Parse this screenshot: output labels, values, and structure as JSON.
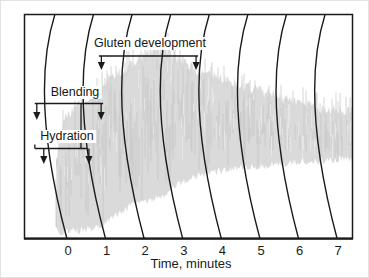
{
  "figure": {
    "background": "#ffffff",
    "line_color": "#1b1b1b",
    "trace_fill": "#dadada",
    "trace_streak_dark": "#c3c3c3",
    "trace_streak_light": "#e7e7e7"
  },
  "chart_data": {
    "type": "area",
    "subtype": "mixograph-recorder-trace",
    "title": "",
    "xlabel": "Time, minutes",
    "ylabel": "",
    "x_ticks": [
      "0",
      "1",
      "2",
      "3",
      "4",
      "5",
      "6",
      "7"
    ],
    "x_tick_values": [
      0,
      1,
      2,
      3,
      4,
      5,
      6,
      7
    ],
    "x_range_minutes": [
      -1.15,
      7.4
    ],
    "y_axis": "relative resistance (no scale shown)",
    "grid": "curved chart-recorder time arcs at each minute",
    "n_arcs": 8,
    "trace_start_minutes": -0.31,
    "trace_end_minutes": 7.38,
    "envelope": [
      {
        "t": -0.31,
        "top": 0.344,
        "bottom": 0.031
      },
      {
        "t": -0.13,
        "top": 0.5,
        "bottom": 0.022
      },
      {
        "t": 0.08,
        "top": 0.567,
        "bottom": 0.031
      },
      {
        "t": 0.47,
        "top": 0.612,
        "bottom": 0.04
      },
      {
        "t": 0.85,
        "top": 0.665,
        "bottom": 0.054
      },
      {
        "t": 1.24,
        "top": 0.723,
        "bottom": 0.098
      },
      {
        "t": 1.63,
        "top": 0.768,
        "bottom": 0.143
      },
      {
        "t": 2.02,
        "top": 0.813,
        "bottom": 0.165
      },
      {
        "t": 2.41,
        "top": 0.853,
        "bottom": 0.179
      },
      {
        "t": 2.8,
        "top": 0.799,
        "bottom": 0.232
      },
      {
        "t": 3.19,
        "top": 0.754,
        "bottom": 0.263
      },
      {
        "t": 3.7,
        "top": 0.723,
        "bottom": 0.29
      },
      {
        "t": 4.22,
        "top": 0.692,
        "bottom": 0.308
      },
      {
        "t": 5.0,
        "top": 0.647,
        "bottom": 0.321
      },
      {
        "t": 5.78,
        "top": 0.603,
        "bottom": 0.335
      },
      {
        "t": 6.55,
        "top": 0.576,
        "bottom": 0.344
      },
      {
        "t": 7.38,
        "top": 0.558,
        "bottom": 0.353
      }
    ],
    "annotations": [
      {
        "label": "Hydration",
        "t_start": -0.86,
        "t_end": 0.49,
        "arrows": "down-both-ends"
      },
      {
        "label": "Blending",
        "t_start": -0.86,
        "t_end": 0.91,
        "arrows": "down-both-ends"
      },
      {
        "label": "Gluten development",
        "t_start": 0.8,
        "t_end": 3.37,
        "arrows": "down-both-ends"
      }
    ]
  }
}
